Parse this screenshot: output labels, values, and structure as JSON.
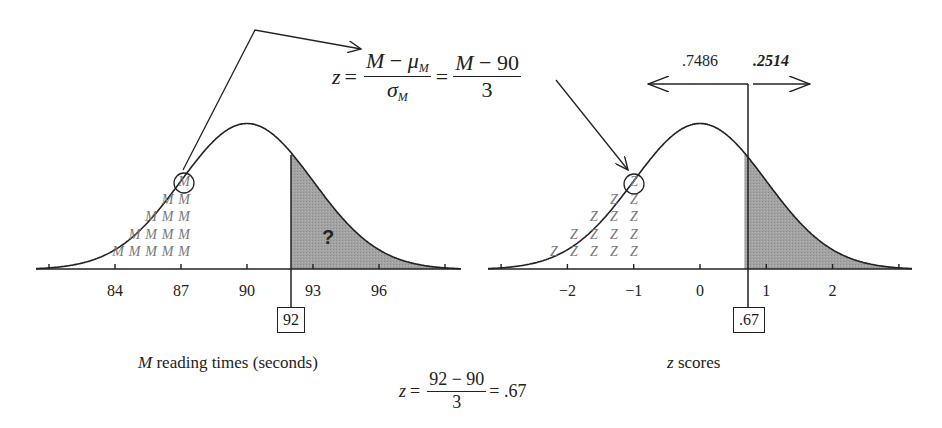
{
  "chart_data": [
    {
      "type": "area",
      "title": "Sampling distribution of M",
      "xlabel": "M reading times (seconds)",
      "xlabel_italic_part": "M",
      "xlabel_rest": "reading times (seconds)",
      "distribution": "normal",
      "mean": 90,
      "sd": 3,
      "xlim": [
        80.4,
        99.7
      ],
      "tick_values": [
        81,
        84,
        87,
        90,
        93,
        96,
        99
      ],
      "tick_labels": [
        "84",
        "87",
        "90",
        "93",
        "96"
      ],
      "tick_labels_at": [
        84,
        87,
        90,
        93,
        96
      ],
      "cutoff": 92,
      "cutoff_label": "92",
      "shaded_region": "right tail (M > 92)",
      "shaded_label": "?",
      "dot_symbol": "M",
      "dot_columns": [
        1,
        2,
        3,
        4,
        5
      ],
      "circled_symbol_at": 87
    },
    {
      "type": "area",
      "title": "Standard normal distribution",
      "xlabel": "z scores",
      "xlabel_italic_part": "z",
      "xlabel_rest": "scores",
      "distribution": "normal",
      "mean": 0,
      "sd": 1,
      "xlim": [
        -3.2,
        3.2
      ],
      "tick_values": [
        -3,
        -2,
        -1,
        0,
        1,
        2,
        3
      ],
      "tick_labels": [
        "−2",
        "−1",
        "0",
        "1",
        "2"
      ],
      "tick_labels_at": [
        -2,
        -1,
        0,
        1,
        2
      ],
      "cutoff": 0.67,
      "cutoff_label": ".67",
      "area_left": 0.7486,
      "area_left_label": ".7486",
      "area_right": 0.2514,
      "area_right_label": ".2514",
      "shaded_region": "right tail (z > .67)",
      "dot_symbol": "Z",
      "circled_symbol_at": -1
    }
  ],
  "formulas": {
    "top": {
      "lhs": "z",
      "eq": "=",
      "frac1_num_a": "M",
      "frac1_num_op": " − ",
      "frac1_num_mu": "μ",
      "frac1_num_sub": "M",
      "frac1_den_sigma": "σ",
      "frac1_den_sub": "M",
      "eq2": "=",
      "frac2_num_a": "M",
      "frac2_num_rest": " − 90",
      "frac2_den": "3"
    },
    "bottom": {
      "lhs": "z",
      "eq": "=",
      "num": "92 − 90",
      "den": "3",
      "result": "= .67"
    }
  },
  "colors": {
    "ink": "#222222",
    "shade": "#9c9c9c",
    "symbols": "#7a7a7a",
    "background": "#ffffff"
  }
}
